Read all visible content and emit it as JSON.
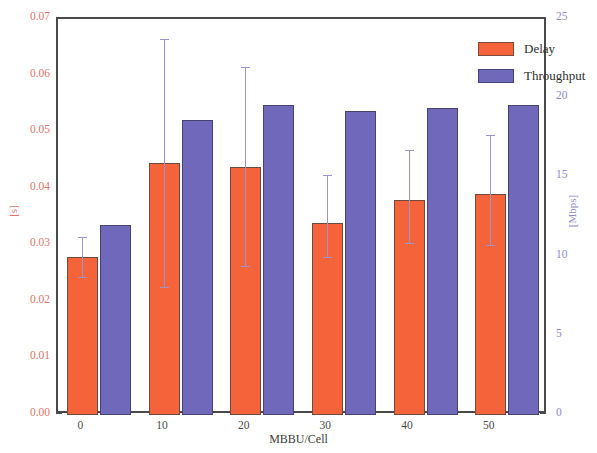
{
  "chart_data": {
    "type": "bar",
    "title": "",
    "xlabel": "MBBU/Cell",
    "categories": [
      "0",
      "10",
      "20",
      "30",
      "40",
      "50"
    ],
    "grid": false,
    "legend_position": "top-right",
    "axes": {
      "left": {
        "label": "[s]",
        "ylim": [
          0.0,
          0.07
        ],
        "ticks": [
          "0.00",
          "0.01",
          "0.02",
          "0.03",
          "0.04",
          "0.05",
          "0.06",
          "0.07"
        ],
        "tick_values": [
          0.0,
          0.01,
          0.02,
          0.03,
          0.04,
          0.05,
          0.06,
          0.07
        ],
        "color": "#e2736a"
      },
      "right": {
        "label": "[Mbps]",
        "ylim": [
          0,
          25
        ],
        "ticks": [
          "0",
          "5",
          "10",
          "15",
          "20",
          "25"
        ],
        "tick_values": [
          0,
          5,
          10,
          15,
          20,
          25
        ],
        "color": "#8f8ac8"
      },
      "x": {
        "label": "MBBU/Cell",
        "ticks": [
          "0",
          "10",
          "20",
          "30",
          "40",
          "50"
        ],
        "tick_values": [
          0,
          10,
          20,
          30,
          40,
          50
        ]
      }
    },
    "series": [
      {
        "name": "Delay",
        "axis": "left",
        "unit": "s",
        "color": "#f4633a",
        "values": [
          0.028,
          0.0445,
          0.0438,
          0.034,
          0.038,
          0.039
        ],
        "error_high": [
          0.0315,
          0.0665,
          0.0615,
          0.0425,
          0.0468,
          0.0495
        ],
        "error_low": [
          0.0243,
          0.0225,
          0.0262,
          0.0277,
          0.0303,
          0.0298
        ]
      },
      {
        "name": "Throughput",
        "axis": "right",
        "unit": "Mbps",
        "color": "#6f68bb",
        "values": [
          12.0,
          18.6,
          19.6,
          19.2,
          19.35,
          19.55
        ],
        "error_high": [
          null,
          null,
          null,
          null,
          null,
          null
        ],
        "error_low": [
          null,
          null,
          null,
          null,
          null,
          null
        ]
      }
    ]
  },
  "legend": {
    "items": [
      {
        "label": "Delay",
        "color": "#f4633a"
      },
      {
        "label": "Throughput",
        "color": "#6f68bb"
      }
    ]
  }
}
